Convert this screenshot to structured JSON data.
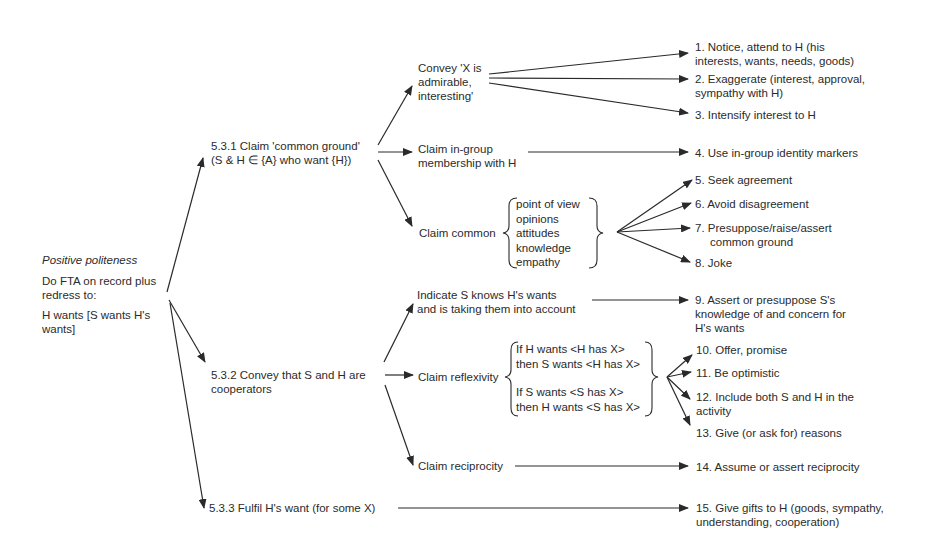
{
  "root": {
    "title": "Positive politeness",
    "line1a": "Do FTA on record plus",
    "line1b": "redress to:",
    "line2a": "H wants [S wants H's",
    "line2b": "wants]"
  },
  "branches": [
    {
      "id": "5.3.1",
      "line1": "5.3.1 Claim 'common ground'",
      "line2": "(S & H ∈ {A} who want {H})",
      "sub": [
        {
          "lines": [
            "Convey 'X is",
            "admirable,",
            "interesting'"
          ]
        },
        {
          "lines": [
            "Claim in-group",
            "membership with H"
          ]
        },
        {
          "label": "Claim common",
          "brace_items": [
            "point of view",
            "opinions",
            "attitudes",
            "knowledge",
            "empathy"
          ]
        }
      ]
    },
    {
      "id": "5.3.2",
      "line1": "5.3.2 Convey that S and H are",
      "line2": "cooperators",
      "sub": [
        {
          "lines": [
            "Indicate S knows H's wants",
            "and is taking them into account"
          ]
        },
        {
          "label": "Claim reflexivity",
          "brace_items": [
            "If H wants <H has X>",
            "then S wants <H has X>",
            "If S wants <S has X>",
            "then H wants <S has X>"
          ]
        },
        {
          "lines": [
            "Claim reciprocity"
          ]
        }
      ]
    },
    {
      "id": "5.3.3",
      "line1": "5.3.3 Fulfil H's want (for some X)"
    }
  ],
  "strategies": [
    {
      "n": 1,
      "lines": [
        "1. Notice, attend to H (his",
        "interests, wants, needs, goods)"
      ]
    },
    {
      "n": 2,
      "lines": [
        "2. Exaggerate (interest, approval,",
        "sympathy with H)"
      ]
    },
    {
      "n": 3,
      "lines": [
        "3. Intensify interest to H"
      ]
    },
    {
      "n": 4,
      "lines": [
        "4. Use in-group identity markers"
      ]
    },
    {
      "n": 5,
      "lines": [
        "5. Seek agreement"
      ]
    },
    {
      "n": 6,
      "lines": [
        "6. Avoid disagreement"
      ]
    },
    {
      "n": 7,
      "lines": [
        "7. Presuppose/raise/assert",
        "common ground"
      ]
    },
    {
      "n": 8,
      "lines": [
        "8. Joke"
      ]
    },
    {
      "n": 9,
      "lines": [
        "9. Assert or presuppose S's",
        "knowledge of and concern for",
        "H's wants"
      ]
    },
    {
      "n": 10,
      "lines": [
        "10. Offer, promise"
      ]
    },
    {
      "n": 11,
      "lines": [
        "11. Be optimistic"
      ]
    },
    {
      "n": 12,
      "lines": [
        "12. Include both S and H in the",
        "activity"
      ]
    },
    {
      "n": 13,
      "lines": [
        "13. Give (or ask for) reasons"
      ]
    },
    {
      "n": 14,
      "lines": [
        "14. Assume or assert reciprocity"
      ]
    },
    {
      "n": 15,
      "lines": [
        "15. Give gifts to H (goods, sympathy,",
        "understanding, cooperation)"
      ]
    }
  ],
  "colors": {
    "line": "#2a2a2a",
    "text": "#2b2b2b",
    "background": "#ffffff"
  }
}
